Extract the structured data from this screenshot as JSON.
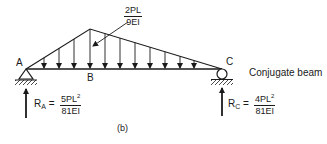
{
  "diagram": {
    "title": "Conjugate beam",
    "caption": "(b)",
    "points": {
      "a": "A",
      "b": "B",
      "c": "C"
    },
    "peak_load": {
      "numerator": "2PL",
      "denominator": "9EI"
    },
    "reaction_a": {
      "label": "R",
      "sub": "A",
      "equals": "=",
      "num_base": "5PL",
      "num_exp": "2",
      "denominator": "81EI"
    },
    "reaction_c": {
      "label": "R",
      "sub": "C",
      "equals": "=",
      "num_base": "4PL",
      "num_exp": "2",
      "denominator": "81EI"
    },
    "geometry": {
      "beam_y": 69,
      "beam_x_start": 26,
      "beam_x_end": 222,
      "apex": [
        90,
        29
      ],
      "load_arrow_x": [
        44,
        59,
        74,
        90,
        105,
        120,
        135,
        150,
        165,
        180,
        194
      ]
    },
    "line_color": "#1a1a1a"
  }
}
